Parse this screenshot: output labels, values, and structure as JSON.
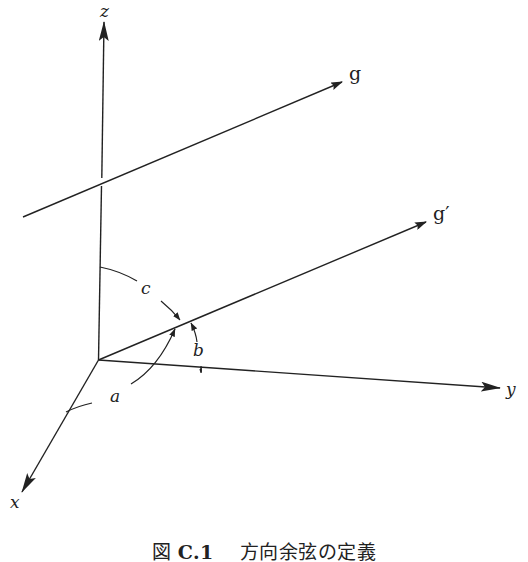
{
  "figure": {
    "type": "3D coordinate diagram",
    "axes": {
      "z": {
        "label": "z"
      },
      "y": {
        "label": "y"
      },
      "x": {
        "label": "x"
      }
    },
    "lines": {
      "g": {
        "label": "g"
      },
      "g_prime": {
        "label": "g′"
      }
    },
    "angles": {
      "a": {
        "label": "a",
        "between": [
          "x",
          "g′"
        ]
      },
      "b": {
        "label": "b",
        "between": [
          "y",
          "g′"
        ]
      },
      "c": {
        "label": "c",
        "between": [
          "z",
          "g′"
        ]
      }
    },
    "stroke_color": "#222222",
    "background_color": "#ffffff"
  },
  "caption": {
    "prefix": "図",
    "number": "C.1",
    "title": "方向余弦の定義"
  }
}
